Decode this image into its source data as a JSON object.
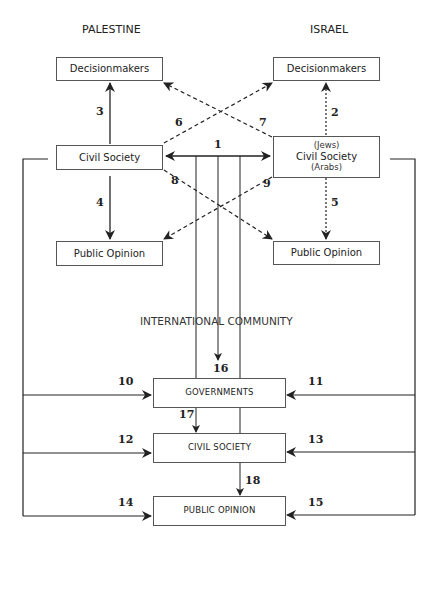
{
  "regions": {
    "palestine": {
      "title": "PALESTINE",
      "decisionmakers": "Decisionmakers",
      "civil_society": "Civil Society",
      "public_opinion": "Public Opinion"
    },
    "israel": {
      "title": "ISRAEL",
      "decisionmakers": "Decisionmakers",
      "civil_society_top": "(Jews)",
      "civil_society": "Civil Society",
      "civil_society_bottom": "(Arabs)",
      "public_opinion": "Public Opinion"
    },
    "international": {
      "title": "INTERNATIONAL COMMUNITY",
      "governments": "GOVERNMENTS",
      "civil_society": "CIVIL SOCIETY",
      "public_opinion": "PUBLIC OPINION"
    }
  },
  "arrows": {
    "n1": "1",
    "n2": "2",
    "n3": "3",
    "n4": "4",
    "n5": "5",
    "n6": "6",
    "n7": "7",
    "n8": "8",
    "n9": "9",
    "n10": "10",
    "n11": "11",
    "n12": "12",
    "n13": "13",
    "n14": "14",
    "n15": "15",
    "n16": "16",
    "n17": "17",
    "n18": "18"
  },
  "arrow_styles": {
    "solid": [
      "1",
      "3",
      "4",
      "10",
      "11",
      "12",
      "13",
      "14",
      "15",
      "16",
      "17",
      "18"
    ],
    "dashed": [
      "6",
      "7",
      "8",
      "9"
    ],
    "dotted": [
      "2",
      "5"
    ]
  },
  "colors": {
    "line": "#222222",
    "box_border": "#555555",
    "international_bg": "#d4d4d4"
  }
}
